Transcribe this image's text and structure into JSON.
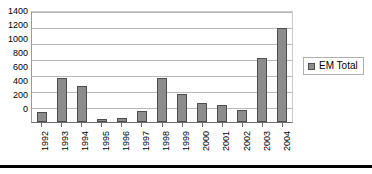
{
  "chart_data": {
    "type": "bar",
    "title": "",
    "xlabel": "",
    "ylabel": "",
    "categories": [
      "1992",
      "1993",
      "1994",
      "1995",
      "1996",
      "1997",
      "1998",
      "1999",
      "2000",
      "2001",
      "2002",
      "2003",
      "2004"
    ],
    "values": [
      120,
      545,
      445,
      40,
      50,
      140,
      545,
      355,
      240,
      215,
      150,
      795,
      1180
    ],
    "series": [
      {
        "name": "EM Total",
        "values": [
          120,
          545,
          445,
          40,
          50,
          140,
          545,
          355,
          240,
          215,
          150,
          795,
          1180
        ]
      }
    ],
    "ylim": [
      0,
      1400
    ],
    "ytick_step": 200,
    "yticks": [
      1400,
      1200,
      1000,
      800,
      600,
      400,
      200,
      0
    ],
    "ytick_labels": [
      "1400",
      "1200",
      "1000",
      "800",
      "600",
      "400",
      "200",
      "0"
    ],
    "grid": true,
    "legend": {
      "position": "right",
      "entries": [
        {
          "label": "EM Total",
          "color": "#8c8c8c"
        }
      ]
    },
    "colors": {
      "bar_fill": "#8c8c8c",
      "bar_stroke": "#4d4d4d",
      "gridline": "#b9b9b9",
      "axis": "#6d6d6d",
      "text": "#000000",
      "background": "#ffffff"
    }
  }
}
